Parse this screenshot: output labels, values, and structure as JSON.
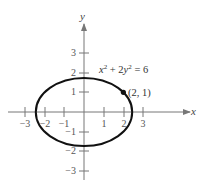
{
  "diagram": {
    "type": "graph-of-equation",
    "equation": "x² + 2y² = 6",
    "equation_parts": {
      "x_term": "x",
      "x_exp": "2",
      "plus": " + 2",
      "y_term": "y",
      "y_exp": "2",
      "rhs": " = 6"
    },
    "curve": {
      "shape": "ellipse",
      "center": [
        0,
        0
      ],
      "semi_axis_x": 2.449,
      "semi_axis_y": 1.732,
      "color": "#111111"
    },
    "marked_point": {
      "coords": [
        2,
        1
      ],
      "label": "(2, 1)"
    },
    "axes": {
      "x_label": "x",
      "y_label": "y",
      "x_ticks": [
        {
          "value": -3,
          "label": "−3"
        },
        {
          "value": -2,
          "label": "−2"
        },
        {
          "value": -1,
          "label": "−1"
        },
        {
          "value": 1,
          "label": "1"
        },
        {
          "value": 2,
          "label": "2"
        },
        {
          "value": 3,
          "label": "3"
        }
      ],
      "y_ticks": [
        {
          "value": 3,
          "label": "3"
        },
        {
          "value": 2,
          "label": "2"
        },
        {
          "value": 1,
          "label": "1"
        },
        {
          "value": -1,
          "label": "−1"
        },
        {
          "value": -2,
          "label": "−2"
        },
        {
          "value": -3,
          "label": "−3"
        }
      ],
      "axis_color": "#777777"
    }
  }
}
